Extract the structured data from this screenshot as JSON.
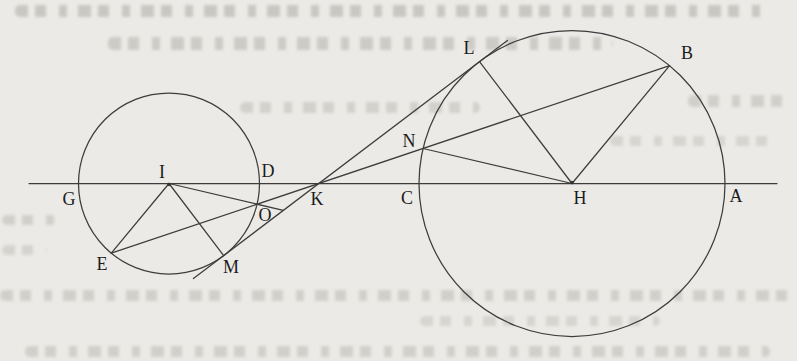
{
  "figure": {
    "type": "geometry-diagram",
    "canvas": {
      "width": 797,
      "height": 361
    },
    "colors": {
      "paper": "#ebeae7",
      "ink": "#3d3d3d",
      "label_ink": "#1c1c1c",
      "bleed_text": "#a8a69d"
    },
    "label_font_size": 18,
    "circles": [
      {
        "name": "small-circle",
        "cx": 169,
        "cy": 183.5,
        "r": 90.5
      },
      {
        "name": "large-circle",
        "cx": 572,
        "cy": 183.5,
        "r": 153
      }
    ],
    "segments": [
      {
        "name": "center-line-GA",
        "x1": 29,
        "y1": 183.5,
        "x2": 777,
        "y2": 183.5
      },
      {
        "name": "tangent-line-MKL",
        "x1": 193.4,
        "y1": 278.6,
        "x2": 507.4,
        "y2": 40.4
      },
      {
        "name": "secant-line-EOKNB",
        "x1": 111.3,
        "y1": 253.2,
        "x2": 669.6,
        "y2": 65.6
      },
      {
        "name": "radius-IE",
        "x1": 169,
        "y1": 183.5,
        "x2": 111.3,
        "y2": 253.2
      },
      {
        "name": "radius-IO-extended",
        "x1": 169,
        "y1": 183.5,
        "x2": 283.3,
        "y2": 210.4
      },
      {
        "name": "radius-IM",
        "x1": 169,
        "y1": 183.5,
        "x2": 223.7,
        "y2": 255.6
      },
      {
        "name": "radius-HN",
        "x1": 572,
        "y1": 183.5,
        "x2": 423.1,
        "y2": 148.5
      },
      {
        "name": "radius-HL",
        "x1": 572,
        "y1": 183.5,
        "x2": 479.5,
        "y2": 61.6
      },
      {
        "name": "radius-HB",
        "x1": 572,
        "y1": 183.5,
        "x2": 669.6,
        "y2": 65.6
      }
    ],
    "dots": [
      {
        "name": "center-I-dot",
        "x": 169,
        "y": 184.5,
        "r": 1.7
      },
      {
        "name": "center-H-dot",
        "x": 572,
        "y": 182.5,
        "r": 1.7
      }
    ],
    "labels": [
      {
        "text": "G",
        "x": 69,
        "y": 199
      },
      {
        "text": "E",
        "x": 102,
        "y": 264
      },
      {
        "text": "I",
        "x": 162,
        "y": 172
      },
      {
        "text": "D",
        "x": 268,
        "y": 171
      },
      {
        "text": "O",
        "x": 265,
        "y": 215
      },
      {
        "text": "M",
        "x": 231,
        "y": 267
      },
      {
        "text": "K",
        "x": 317,
        "y": 199
      },
      {
        "text": "C",
        "x": 407,
        "y": 198
      },
      {
        "text": "N",
        "x": 409,
        "y": 141
      },
      {
        "text": "L",
        "x": 469,
        "y": 48
      },
      {
        "text": "H",
        "x": 580,
        "y": 198
      },
      {
        "text": "B",
        "x": 687,
        "y": 53
      },
      {
        "text": "A",
        "x": 736,
        "y": 196
      }
    ],
    "smudges": [
      {
        "x": 15,
        "y": 5,
        "w": 755,
        "h": 12,
        "o": 0.5
      },
      {
        "x": 108,
        "y": 37,
        "w": 505,
        "h": 13,
        "o": 0.45
      },
      {
        "x": 688,
        "y": 95,
        "w": 105,
        "h": 12,
        "o": 0.38
      },
      {
        "x": 240,
        "y": 102,
        "w": 240,
        "h": 11,
        "o": 0.36
      },
      {
        "x": 610,
        "y": 136,
        "w": 170,
        "h": 10,
        "o": 0.3
      },
      {
        "x": 2,
        "y": 215,
        "w": 55,
        "h": 10,
        "o": 0.38
      },
      {
        "x": 2,
        "y": 245,
        "w": 45,
        "h": 10,
        "o": 0.32
      },
      {
        "x": 0,
        "y": 290,
        "w": 790,
        "h": 11,
        "o": 0.38
      },
      {
        "x": 420,
        "y": 316,
        "w": 240,
        "h": 10,
        "o": 0.3
      },
      {
        "x": 25,
        "y": 346,
        "w": 745,
        "h": 11,
        "o": 0.38
      }
    ]
  }
}
